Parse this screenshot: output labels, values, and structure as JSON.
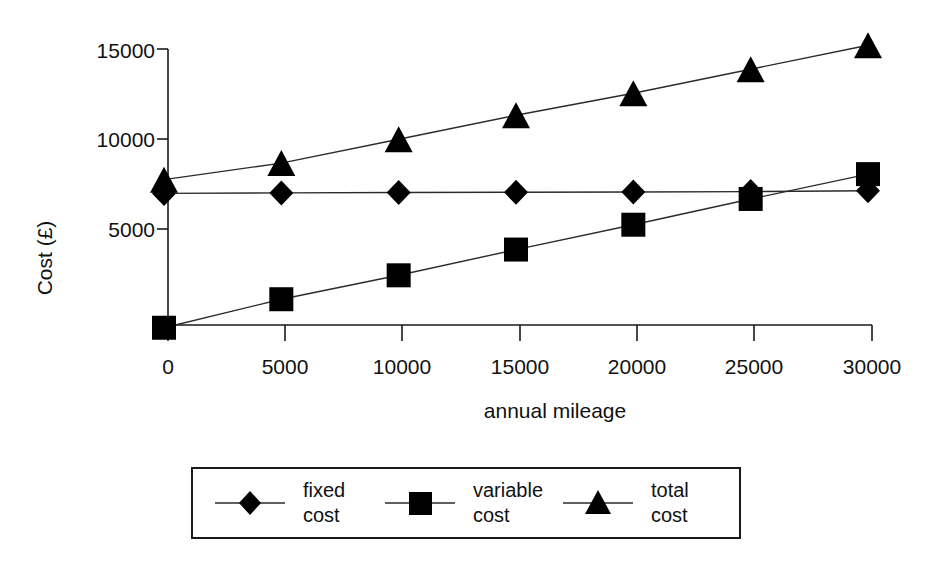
{
  "chart_data": {
    "type": "line",
    "title": "",
    "xlabel": "annual mileage",
    "ylabel": "Cost (£)",
    "x": [
      0,
      5000,
      10000,
      15000,
      20000,
      25000,
      30000
    ],
    "xticklabels": [
      "0",
      "5000",
      "10000",
      "15000",
      "20000",
      "25000",
      "30000"
    ],
    "yticklabels": [
      "0",
      "5000",
      "10000",
      "15000"
    ],
    "yticks": [
      0,
      5000,
      10000,
      15000
    ],
    "xlim": [
      0,
      30000
    ],
    "ylim": [
      -500,
      15500
    ],
    "grid": false,
    "legend_position": "below-plot",
    "series": [
      {
        "name": "fixed cost",
        "label_line1": "fixed",
        "label_line2": "cost",
        "marker": "diamond",
        "values": [
          7150,
          7180,
          7200,
          7210,
          7230,
          7250,
          7300
        ]
      },
      {
        "name": "variable cost",
        "label_line1": "variable",
        "label_line2": "cost",
        "marker": "square",
        "values": [
          -150,
          1400,
          2700,
          4100,
          5450,
          6850,
          8200
        ]
      },
      {
        "name": "total cost",
        "label_line1": "total",
        "label_line2": "cost",
        "marker": "triangle",
        "values": [
          7900,
          8800,
          10100,
          11400,
          12600,
          13900,
          15200
        ]
      }
    ]
  },
  "colors": {
    "ink": "#000000",
    "line": "#2b2b2b",
    "axis": "#1a1a1a",
    "background": "#ffffff"
  }
}
